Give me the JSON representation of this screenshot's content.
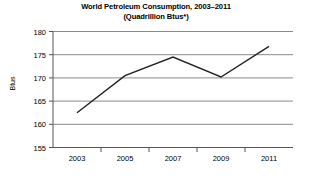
{
  "chart_data": {
    "type": "line",
    "title": "World Petroleum Consumption, 2003–2011",
    "subtitle": "(Quadrillion Btus*)",
    "xlabel": "",
    "ylabel": "Btus",
    "x": [
      2003,
      2005,
      2007,
      2009,
      2011
    ],
    "values": [
      162.5,
      170.5,
      174.5,
      170.2,
      176.8
    ],
    "categories": [
      "2003",
      "2005",
      "2007",
      "2009",
      "2011"
    ],
    "xtick_labels": [
      "2003",
      "2005",
      "2007",
      "2009",
      "2011"
    ],
    "ytick_labels": [
      "155",
      "160",
      "165",
      "170",
      "175",
      "180"
    ],
    "yticks": [
      155,
      160,
      165,
      170,
      175,
      180
    ],
    "xlim": [
      2002,
      2012
    ],
    "ylim": [
      155,
      180
    ],
    "grid": true,
    "grid_axis": "y",
    "legend": false,
    "legend_position": "none",
    "line_color": "#222222",
    "grid_color": "#999999",
    "axis_color": "#555555",
    "background_color": "#ffffff",
    "minor_xticks": [
      "2004",
      "2006",
      "2008",
      "2010"
    ],
    "series": [
      {
        "name": "World Petroleum Consumption",
        "values": [
          162.5,
          170.5,
          174.5,
          170.2,
          176.8
        ]
      }
    ]
  }
}
